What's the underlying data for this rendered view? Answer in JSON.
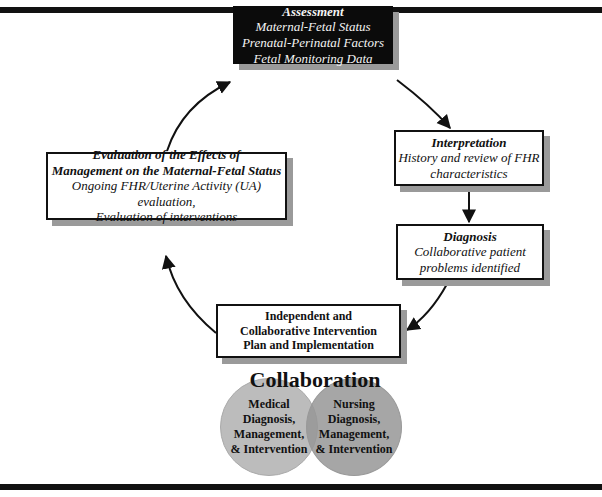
{
  "diagram": {
    "assessment": {
      "title": "Assessment",
      "lines": [
        "Maternal-Fetal Status",
        "Prenatal-Perinatal Factors",
        "Fetal Monitoring Data"
      ]
    },
    "interpretation": {
      "title": "Interpretation",
      "lines": [
        "History and review of FHR",
        "characteristics"
      ]
    },
    "diagnosis": {
      "title": "Diagnosis",
      "lines": [
        "Collaborative patient",
        "problems identified"
      ]
    },
    "intervention": {
      "lines": [
        "Independent and",
        "Collaborative Intervention",
        "Plan and Implementation"
      ]
    },
    "evaluation": {
      "title_lines": [
        "Evaluation of the Effects of",
        "Management on the Maternal-Fetal Status"
      ],
      "lines": [
        "Ongoing FHR/Uterine Activity (UA) evaluation,",
        "Evaluation of interventions"
      ]
    },
    "collaboration": {
      "title": "Collaboration",
      "medical": [
        "Medical",
        "Diagnosis,",
        "Management,",
        "& Intervention"
      ],
      "nursing": [
        "Nursing",
        "Diagnosis,",
        "Management,",
        "& Intervention"
      ]
    },
    "colors": {
      "assessment_bg": "#0b0b0b",
      "shadow": "#9a9a9a",
      "medical_circle": "#b9b9b9",
      "nursing_circle": "#a4a4a4",
      "bars": "#111111"
    }
  }
}
